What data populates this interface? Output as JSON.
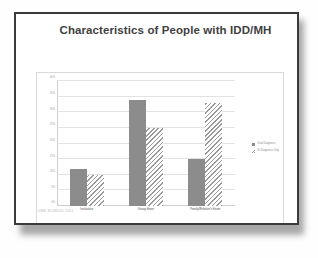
{
  "slide": {
    "title": "Characteristics of People with IDD/MH",
    "footer": "UMS NCBDDD  2011"
  },
  "chart_data": {
    "type": "bar",
    "title": "",
    "xlabel": "",
    "ylabel": "",
    "ylim": [
      0,
      40
    ],
    "grid": true,
    "legend_position": "right",
    "categories": [
      "Institution",
      "Group Home",
      "Family/Relative's Home"
    ],
    "ytick_labels": [
      "0%",
      "5%",
      "10%",
      "15%",
      "20%",
      "25%",
      "30%",
      "35%",
      "40%"
    ],
    "ytick_values": [
      0,
      5,
      10,
      15,
      20,
      25,
      30,
      35,
      40
    ],
    "series": [
      {
        "name": "Dual Diagnosis",
        "style": "solid",
        "color": "#8c8c8c",
        "values": [
          12,
          34,
          15
        ]
      },
      {
        "name": "ID Diagnosis Only",
        "style": "hatched",
        "color": "#9a9a9a",
        "values": [
          10,
          25,
          33
        ]
      }
    ]
  }
}
